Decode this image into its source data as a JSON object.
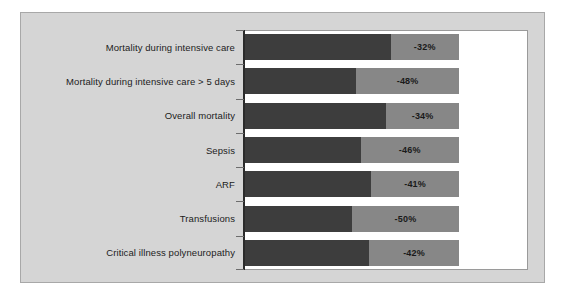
{
  "chart_data": {
    "type": "bar",
    "orientation": "horizontal",
    "stacked": true,
    "title": "",
    "subtitle": "",
    "xlabel": "",
    "ylabel": "",
    "categories": [
      "Mortality during intensive care",
      "Mortality during intensive care > 5 days",
      "Overall mortality",
      "Sepsis",
      "ARF",
      "Transfusions",
      "Critical illness polyneuropathy"
    ],
    "values": [
      -32,
      -48,
      -34,
      -46,
      -41,
      -50,
      -42
    ],
    "data_labels": [
      "-32%",
      "-48%",
      "-34%",
      "-46%",
      "-41%",
      "-50%",
      "-42%"
    ],
    "series": [
      {
        "name": "remainder",
        "color": "#3d3d3d",
        "values": [
          68,
          52,
          66,
          54,
          59,
          50,
          58
        ]
      },
      {
        "name": "reduction",
        "color": "#878787",
        "values": [
          32,
          48,
          34,
          46,
          41,
          50,
          42
        ]
      }
    ],
    "xlim": [
      0,
      100
    ],
    "grid": false,
    "legend": "none",
    "axis_ticks": true
  },
  "colors": {
    "figure_background": "#d5d5d5",
    "figure_border": "#a8a8a8",
    "plot_background": "#ffffff",
    "plot_border": "#9a9a9a",
    "axis_line": "#2b2b2b",
    "bar_dark": "#3d3d3d",
    "bar_light": "#878787",
    "label_text": "#1c1c1c",
    "value_text": "#1a1a1a"
  }
}
